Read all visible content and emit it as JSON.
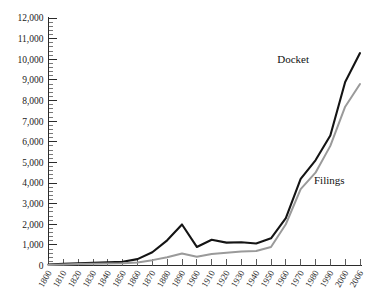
{
  "chart_data": {
    "type": "line",
    "title": "",
    "subtitle": "",
    "xlabel": "",
    "ylabel": "",
    "xlim": [
      1800,
      2006
    ],
    "ylim": [
      0,
      12000
    ],
    "grid": false,
    "legend_position": "inline-right",
    "y_ticks": [
      0,
      1000,
      2000,
      3000,
      4000,
      5000,
      6000,
      7000,
      8000,
      9000,
      10000,
      11000,
      12000
    ],
    "y_tick_labels": [
      "0",
      "1,000",
      "2,000",
      "3,000",
      "4,000",
      "5,000",
      "6,000",
      "7,000",
      "8,000",
      "9,000",
      "10,000",
      "11,000",
      "12,000"
    ],
    "y_minor_tick_step": 200,
    "x": [
      1800,
      1810,
      1820,
      1830,
      1840,
      1850,
      1860,
      1870,
      1880,
      1890,
      1900,
      1910,
      1920,
      1930,
      1940,
      1950,
      1960,
      1970,
      1980,
      1990,
      2000,
      2006
    ],
    "categories": [
      "1800",
      "1810",
      "1820",
      "1830",
      "1840",
      "1850",
      "1860",
      "1870",
      "1880",
      "1890",
      "1900",
      "1910",
      "1920",
      "1930",
      "1940",
      "1950",
      "1960",
      "1970",
      "1980",
      "1990",
      "2000",
      "2006"
    ],
    "series": [
      {
        "name": "Docket",
        "color": "#141414",
        "values": [
          50,
          80,
          110,
          130,
          150,
          180,
          310,
          640,
          1220,
          1990,
          900,
          1250,
          1110,
          1130,
          1070,
          1320,
          2300,
          4200,
          5100,
          6300,
          8900,
          10300
        ]
      },
      {
        "name": "Filings",
        "color": "#9a9a9a",
        "values": [
          30,
          50,
          70,
          80,
          95,
          110,
          150,
          260,
          400,
          580,
          420,
          560,
          620,
          680,
          700,
          900,
          2000,
          3700,
          4500,
          5800,
          7700,
          8800
        ]
      }
    ]
  },
  "labels": {
    "docket": "Docket",
    "filings": "Filings"
  }
}
